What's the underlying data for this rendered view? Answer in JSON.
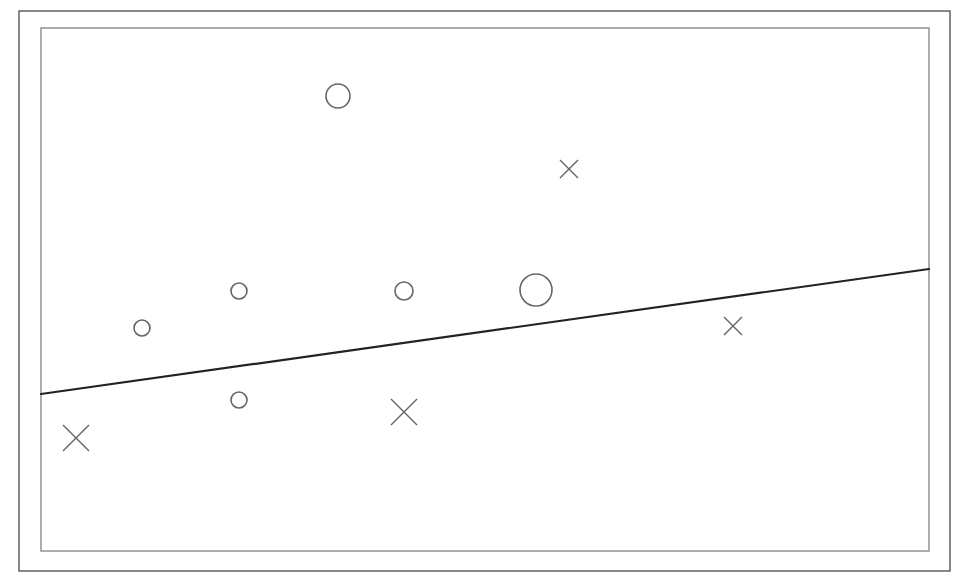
{
  "chart_data": {
    "type": "scatter",
    "title": "",
    "xlabel": "",
    "ylabel": "",
    "grid": false,
    "legend": null,
    "frame": {
      "outer": {
        "x": 19,
        "y": 11,
        "w": 931,
        "h": 560,
        "color": "#555555"
      },
      "inner": {
        "x": 41,
        "y": 28,
        "w": 888,
        "h": 523,
        "color": "#8a8a8a"
      }
    },
    "series": [
      {
        "name": "circles",
        "marker": "circle",
        "color": "#666666",
        "points": [
          {
            "x": 142,
            "y": 328,
            "size": 8
          },
          {
            "x": 239,
            "y": 291,
            "size": 8
          },
          {
            "x": 239,
            "y": 400,
            "size": 8
          },
          {
            "x": 338,
            "y": 96,
            "size": 12
          },
          {
            "x": 404,
            "y": 291,
            "size": 9
          },
          {
            "x": 536,
            "y": 290,
            "size": 16
          }
        ]
      },
      {
        "name": "crosses",
        "marker": "x",
        "color": "#666666",
        "points": [
          {
            "x": 76,
            "y": 438,
            "size": 13
          },
          {
            "x": 404,
            "y": 412,
            "size": 13
          },
          {
            "x": 569,
            "y": 169,
            "size": 9
          },
          {
            "x": 733,
            "y": 326,
            "size": 9
          }
        ]
      }
    ],
    "decision_line": {
      "x1": 41,
      "y1": 394,
      "x2": 929,
      "y2": 269,
      "color": "#222222",
      "width": 2.2
    }
  }
}
